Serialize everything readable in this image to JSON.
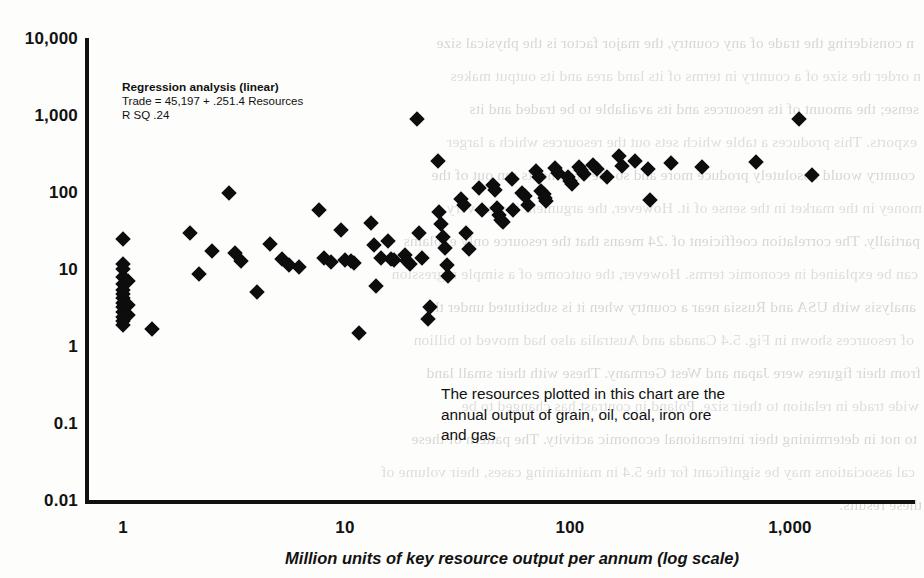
{
  "chart_data": {
    "type": "scatter",
    "title": "",
    "xlabel": "Million units of key resource output per annum (log scale)",
    "ylabel": "",
    "xscale": "log",
    "yscale": "log",
    "xlim": [
      0.55,
      4500
    ],
    "ylim": [
      0.01,
      10000
    ],
    "grid": false,
    "legend": "none",
    "xticks": [
      "1",
      "10",
      "100",
      "1,000"
    ],
    "xtick_values": [
      1,
      10,
      100,
      1000
    ],
    "yticks": [
      "10,000",
      "1,000",
      "100",
      "10",
      "1",
      "0.1",
      "0.01"
    ],
    "ytick_values": [
      10000,
      1000,
      100,
      10,
      1,
      0.1,
      0.01
    ],
    "marker": "diamond",
    "marker_color": "#0d0d0d",
    "annotations": [
      {
        "name": "regression-box",
        "lines": [
          "Regression analysis (linear)",
          "Trade = 45,197 + .251.4 Resources",
          "R SQ .24"
        ]
      },
      {
        "name": "resource-note",
        "text": "The resources plotted in this chart are the\nannual output of grain, oil, coal, iron ore\nand gas"
      }
    ],
    "points": [
      [
        1.0,
        25.0
      ],
      [
        1.0,
        12.0
      ],
      [
        1.0,
        10.2
      ],
      [
        1.0,
        8.2
      ],
      [
        1.0,
        6.6
      ],
      [
        1.0,
        5.6
      ],
      [
        1.0,
        4.9
      ],
      [
        1.0,
        4.3
      ],
      [
        1.0,
        3.8
      ],
      [
        1.0,
        3.3
      ],
      [
        1.0,
        2.9
      ],
      [
        1.0,
        2.5
      ],
      [
        1.0,
        2.2
      ],
      [
        1.0,
        1.95
      ],
      [
        1.05,
        7.3
      ],
      [
        1.05,
        3.55
      ],
      [
        1.05,
        2.65
      ],
      [
        1.35,
        1.75
      ],
      [
        2.0,
        30.0
      ],
      [
        2.2,
        9.0
      ],
      [
        2.5,
        17.5
      ],
      [
        3.0,
        100.0
      ],
      [
        3.2,
        16.5
      ],
      [
        3.4,
        13.0
      ],
      [
        4.0,
        5.2
      ],
      [
        4.6,
        22.0
      ],
      [
        5.2,
        14.0
      ],
      [
        5.6,
        11.5
      ],
      [
        6.2,
        11.0
      ],
      [
        7.6,
        60.0
      ],
      [
        8.0,
        14.5
      ],
      [
        8.6,
        12.8
      ],
      [
        9.6,
        33.0
      ],
      [
        10.0,
        13.3
      ],
      [
        10.6,
        13.0
      ],
      [
        10.9,
        12.5
      ],
      [
        11.5,
        1.55
      ],
      [
        13.0,
        41.0
      ],
      [
        13.5,
        21.0
      ],
      [
        13.8,
        6.2
      ],
      [
        14.5,
        14.2
      ],
      [
        15.5,
        24.0
      ],
      [
        16.0,
        13.8
      ],
      [
        16.5,
        13.5
      ],
      [
        18.5,
        15.5
      ],
      [
        19.0,
        13.0
      ],
      [
        19.5,
        12.0
      ],
      [
        21.0,
        900.0
      ],
      [
        21.5,
        30.0
      ],
      [
        22.0,
        14.5
      ],
      [
        23.5,
        2.3
      ],
      [
        24.0,
        3.3
      ],
      [
        26.0,
        260.0
      ],
      [
        26.5,
        56.0
      ],
      [
        27.0,
        39.0
      ],
      [
        27.5,
        27.0
      ],
      [
        28.0,
        19.0
      ],
      [
        28.5,
        11.5
      ],
      [
        29.0,
        8.4
      ],
      [
        33.0,
        84.0
      ],
      [
        34.0,
        70.0
      ],
      [
        35.0,
        30.0
      ],
      [
        36.0,
        18.5
      ],
      [
        40.0,
        115.0
      ],
      [
        41.0,
        60.0
      ],
      [
        46.0,
        125.0
      ],
      [
        47.0,
        110.0
      ],
      [
        48.0,
        63.0
      ],
      [
        49.0,
        52.0
      ],
      [
        50.0,
        45.0
      ],
      [
        51.0,
        42.0
      ],
      [
        56.0,
        150.0
      ],
      [
        57.0,
        60.0
      ],
      [
        62.0,
        100.0
      ],
      [
        64.0,
        90.0
      ],
      [
        66.0,
        70.0
      ],
      [
        72.0,
        190.0
      ],
      [
        74.0,
        160.0
      ],
      [
        76.0,
        105.0
      ],
      [
        78.0,
        95.0
      ],
      [
        79.0,
        85.0
      ],
      [
        80.0,
        78.0
      ],
      [
        88.0,
        210.0
      ],
      [
        90.0,
        180.0
      ],
      [
        100.0,
        160.0
      ],
      [
        102.0,
        140.0
      ],
      [
        105.0,
        130.0
      ],
      [
        112.0,
        215.0
      ],
      [
        115.0,
        195.0
      ],
      [
        118.0,
        175.0
      ],
      [
        130.0,
        230.0
      ],
      [
        135.0,
        200.0
      ],
      [
        150.0,
        160.0
      ],
      [
        170.0,
        300.0
      ],
      [
        175.0,
        220.0
      ],
      [
        200.0,
        260.0
      ],
      [
        230.0,
        200.0
      ],
      [
        235.0,
        80.0
      ],
      [
        290.0,
        240.0
      ],
      [
        400.0,
        215.0
      ],
      [
        700.0,
        250.0
      ],
      [
        1100.0,
        900.0
      ],
      [
        1250.0,
        170.0
      ]
    ]
  },
  "bleed_text": {
    "lines": [
      "n considering the trade of any country, the major factor is the physical size",
      "n order the size of a country in terms of its land area and its output makes",
      "sense; the amount of its resources and its available to be traded and its",
      "exports. This produces a table which sets out the resources which a larger",
      "country would absolutely produce more and so the arguments ran out of the",
      "money in the market in the sense of it. However, the argument is also very",
      "partially. The correlation coefficient of .24 means that the resource only explains",
      "can be explained in economic terms. However, the outcome of a simple regression",
      "analysis with USA and Russia near a country when it is substituted under the",
      "of resources shown in Fig. 5.4 Canada and Australia also had moved to billion",
      "from their figures were Japan and West Germany. These with their small land",
      "wide trade in relation to their size. Poland in contrast has changed to be",
      "to not in determining their international economic activity. The pattern of these",
      "cal associations may be significant for the 5.4 in maintaining cases, their volume of",
      "these results."
    ]
  }
}
